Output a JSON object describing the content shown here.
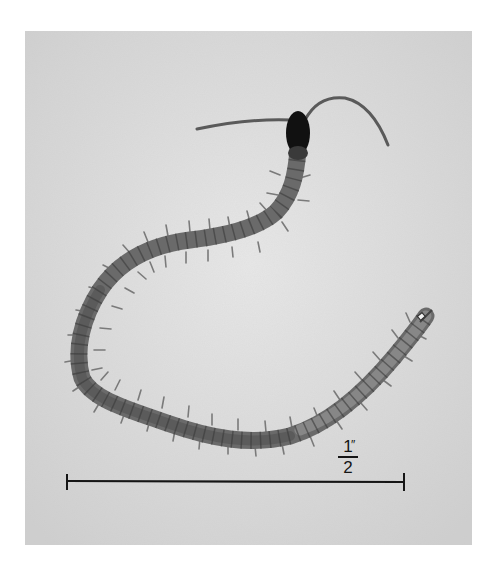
{
  "figure": {
    "background_color": "#d9d9d9",
    "page_color": "#ffffff",
    "specimen_color": "#6e6e6e",
    "head_color": "#111111"
  },
  "scale_bar": {
    "numerator": "1",
    "denominator": "2",
    "unit_mark": "″",
    "label": "1/2″"
  }
}
